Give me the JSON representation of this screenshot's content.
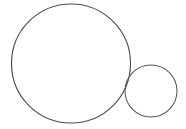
{
  "canvas": {
    "width": 186,
    "height": 129,
    "background_color": "#ffffff",
    "description": "line-drawing-two-tangent-circles"
  },
  "figure": {
    "name": "two-tangent-circles-diagram",
    "stroke_color": "#4e4e50",
    "secondary_stroke_color": "#6d6d70",
    "fill_color": "none",
    "shape_count": 2
  },
  "shapes": [
    {
      "name": "large-circle",
      "type": "circle",
      "cx": 71,
      "cy": 63.5,
      "r": 59.5,
      "stroke_width": 1.15,
      "stroke_color": "#4e4e50",
      "fill": "none",
      "bounds": {
        "left": 11.5,
        "right": 130.5,
        "top": 4,
        "bottom": 123
      }
    },
    {
      "name": "small-circle",
      "type": "circle",
      "cx": 151,
      "cy": 91,
      "r": 26,
      "stroke_width": 1.05,
      "stroke_color": "#57575a",
      "fill": "none",
      "bounds": {
        "left": 125,
        "right": 177,
        "top": 65,
        "bottom": 117
      }
    }
  ],
  "relationship": {
    "name": "external-tangency",
    "tangent_point_x": 128,
    "tangent_point_y": 74
  }
}
